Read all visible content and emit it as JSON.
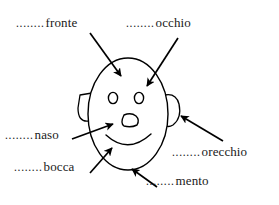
{
  "page": {
    "background_color": "#ffffff",
    "ink_color": "#000000",
    "width": 279,
    "height": 205
  },
  "dot_leader": "........",
  "labels": [
    {
      "id": "fronte",
      "dots": "........",
      "word": "fronte",
      "meaning": "forehead",
      "points_to": "forehead"
    },
    {
      "id": "occhio",
      "dots": "........",
      "word": "occhio",
      "meaning": "eye",
      "points_to": "right-eye"
    },
    {
      "id": "naso",
      "dots": "........",
      "word": "naso",
      "meaning": "nose",
      "points_to": "nose"
    },
    {
      "id": "bocca",
      "dots": "........",
      "word": "bocca",
      "meaning": "mouth",
      "points_to": "mouth"
    },
    {
      "id": "orecchio",
      "dots": "........",
      "word": "orecchio",
      "meaning": "ear",
      "points_to": "right-ear"
    },
    {
      "id": "mento",
      "dots": "........",
      "word": "mento",
      "meaning": "chin",
      "points_to": "chin"
    }
  ],
  "drawing": {
    "name": "cartoon-face",
    "face_outline": {
      "cx": 128,
      "cy": 114,
      "rx": 40,
      "ry": 56
    },
    "left_eye": {
      "cx": 113,
      "cy": 98,
      "rx": 4.5,
      "ry": 5.5
    },
    "right_eye": {
      "cx": 138,
      "cy": 98,
      "rx": 4.5,
      "ry": 5.5
    },
    "nose": {
      "cx": 128,
      "cy": 122
    },
    "mouth": {
      "type": "smile-arc",
      "cx": 128,
      "cy": 136
    },
    "left_ear": {
      "cx": 85,
      "cy": 107
    },
    "right_ear": {
      "cx": 172,
      "cy": 110
    }
  },
  "arrows": [
    {
      "id": "arrow-fronte",
      "from": [
        90,
        33
      ],
      "to": [
        122,
        77
      ]
    },
    {
      "id": "arrow-occhio",
      "from": [
        178,
        38
      ],
      "to": [
        146,
        87
      ]
    },
    {
      "id": "arrow-naso",
      "from": [
        72,
        139
      ],
      "to": [
        114,
        124
      ]
    },
    {
      "id": "arrow-bocca",
      "from": [
        90,
        173
      ],
      "to": [
        112,
        147
      ]
    },
    {
      "id": "arrow-orecchio",
      "from": [
        223,
        141
      ],
      "to": [
        180,
        115
      ]
    },
    {
      "id": "arrow-mento",
      "from": [
        157,
        187
      ],
      "to": [
        131,
        168
      ]
    }
  ]
}
